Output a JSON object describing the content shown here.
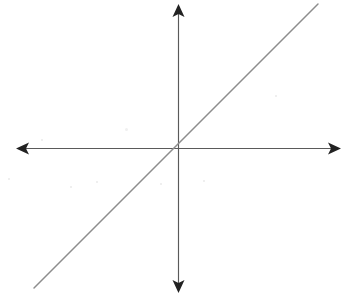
{
  "figure": {
    "background_color": "#ffffff",
    "width": 352,
    "height": 306
  },
  "chart_data": {
    "type": "line",
    "title": "",
    "subtitle": "",
    "xlabel": "",
    "ylabel": "",
    "grid": false,
    "legend": false,
    "legend_position": "none",
    "axis_style": "double-arrow-cartesian",
    "origin_pixel": {
      "x": 178,
      "y": 148
    },
    "axes": {
      "x_axis": {
        "name": "x-axis",
        "orientation": "horizontal",
        "pixel_y": 148,
        "pixel_start_x": 16,
        "pixel_end_x": 341,
        "arrowheads": [
          "left",
          "right"
        ],
        "tick_labels": [],
        "color": "#5a5a5a"
      },
      "y_axis": {
        "name": "y-axis",
        "orientation": "vertical",
        "pixel_x": 178,
        "pixel_start_y": 4,
        "pixel_end_y": 293,
        "arrowheads": [
          "up",
          "down"
        ],
        "tick_labels": [],
        "color": "#5a5a5a"
      }
    },
    "xlim": [
      -4.5,
      4.5
    ],
    "ylim": [
      -4.0,
      4.0
    ],
    "series": [
      {
        "name": "line",
        "label": "",
        "color": "#8d8d8d",
        "slope": 1,
        "intercept": 0,
        "equation": "y = x",
        "x": [
          -4.0,
          -2.0,
          0.0,
          2.0,
          4.0
        ],
        "values": [
          -4.0,
          -2.0,
          0.0,
          2.0,
          4.0
        ],
        "pixel_endpoints": {
          "start": {
            "x": 34,
            "y": 288
          },
          "end": {
            "x": 318,
            "y": 4
          }
        }
      }
    ],
    "annotations": []
  },
  "artifacts": {
    "description": "faint scanner specks on white paper",
    "specks": [
      {
        "x": 125,
        "y": 128,
        "size": 3,
        "kind": "smudge"
      },
      {
        "x": 41,
        "y": 139,
        "size": 2,
        "kind": "speck"
      },
      {
        "x": 96,
        "y": 181,
        "size": 2,
        "kind": "speck"
      },
      {
        "x": 275,
        "y": 95,
        "size": 2,
        "kind": "speck"
      },
      {
        "x": 203,
        "y": 180,
        "size": 2,
        "kind": "speck"
      },
      {
        "x": 160,
        "y": 183,
        "size": 2,
        "kind": "speck"
      },
      {
        "x": 70,
        "y": 186,
        "size": 2,
        "kind": "speck"
      },
      {
        "x": 8,
        "y": 178,
        "size": 2,
        "kind": "speck"
      }
    ]
  }
}
